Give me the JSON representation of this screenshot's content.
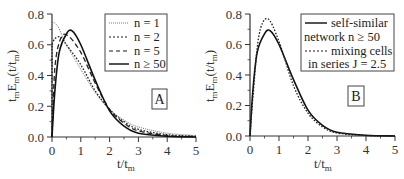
{
  "chart_data": [
    {
      "panel": "A",
      "type": "line",
      "title": "",
      "xlabel": "t/t_m",
      "ylabel": "t_m E_m(t/t_m)",
      "xlim": [
        0,
        5
      ],
      "ylim": [
        0,
        0.8
      ],
      "xticks": [
        "0",
        "1",
        "2",
        "3",
        "4",
        "5"
      ],
      "yticks": [
        "0.0",
        "0.2",
        "0.4",
        "0.6",
        "0.8"
      ],
      "grid": false,
      "legend_position": "upper right",
      "series": [
        {
          "name": "n = 1",
          "style": "dotted-fine",
          "x": [
            0,
            0.2,
            0.5,
            1.0,
            1.5,
            2.0,
            2.5,
            3.0,
            4.0,
            5.0
          ],
          "y": [
            0.75,
            0.72,
            0.6,
            0.44,
            0.29,
            0.18,
            0.11,
            0.065,
            0.025,
            0.01
          ]
        },
        {
          "name": "n = 2",
          "style": "dotted",
          "x": [
            0,
            0.1,
            0.3,
            0.5,
            1.0,
            1.5,
            2.0,
            2.5,
            3.0,
            4.0,
            5.0
          ],
          "y": [
            0.6,
            0.64,
            0.65,
            0.6,
            0.47,
            0.3,
            0.18,
            0.1,
            0.05,
            0.015,
            0.005
          ]
        },
        {
          "name": "n = 5",
          "style": "dashed",
          "x": [
            0,
            0.1,
            0.3,
            0.55,
            1.0,
            1.5,
            2.0,
            2.5,
            3.0,
            4.0,
            5.0
          ],
          "y": [
            0,
            0.45,
            0.64,
            0.66,
            0.55,
            0.35,
            0.18,
            0.09,
            0.04,
            0.01,
            0.003
          ]
        },
        {
          "name": "n ≥ 50",
          "style": "solid",
          "x": [
            0,
            0.1,
            0.25,
            0.5,
            0.7,
            1.0,
            1.5,
            2.0,
            2.5,
            3.0,
            4.0,
            5.0
          ],
          "y": [
            0,
            0.3,
            0.55,
            0.67,
            0.69,
            0.6,
            0.37,
            0.17,
            0.07,
            0.025,
            0.005,
            0
          ]
        }
      ],
      "annotation": "A"
    },
    {
      "panel": "B",
      "type": "line",
      "title": "",
      "xlabel": "t/t_m",
      "ylabel": "t_m E_m(t/t_m)",
      "xlim": [
        0,
        5
      ],
      "ylim": [
        0,
        0.8
      ],
      "xticks": [
        "0",
        "1",
        "2",
        "3",
        "4",
        "5"
      ],
      "yticks": [
        "0.0",
        "0.2",
        "0.4",
        "0.6",
        "0.8"
      ],
      "grid": false,
      "legend_position": "upper right",
      "series": [
        {
          "name": "self-similar network n ≥ 50",
          "style": "solid",
          "x": [
            0,
            0.1,
            0.25,
            0.5,
            0.7,
            1.0,
            1.5,
            2.0,
            2.5,
            3.0,
            4.0,
            5.0
          ],
          "y": [
            0,
            0.3,
            0.55,
            0.67,
            0.69,
            0.6,
            0.37,
            0.17,
            0.07,
            0.025,
            0.005,
            0
          ]
        },
        {
          "name": "mixing cells in series J = 2.5",
          "style": "dotted",
          "x": [
            0,
            0.1,
            0.3,
            0.6,
            1.0,
            1.5,
            2.0,
            2.5,
            3.0,
            4.0,
            5.0
          ],
          "y": [
            0,
            0.25,
            0.65,
            0.77,
            0.62,
            0.33,
            0.15,
            0.06,
            0.02,
            0.003,
            0
          ]
        }
      ],
      "annotation": "B"
    }
  ],
  "panels": {
    "A": {
      "legend": [
        "n = 1",
        "n = 2",
        "n = 5",
        "n ≥ 50"
      ],
      "letter": "A",
      "xlabel_main": "t/t",
      "xlabel_sub": "m",
      "ylabel": "t_m E_m(t/t_m)"
    },
    "B": {
      "legend": [
        "self-similar",
        "network n ≥ 50",
        "mixing cells",
        "in series J = 2.5"
      ],
      "letter": "B",
      "xlabel_main": "t/t",
      "xlabel_sub": "m",
      "ylabel": "t_m E_m(t/t_m)"
    }
  },
  "colors": {
    "line": "#1a1a1a",
    "axis": "#333333",
    "frame": "#444444"
  }
}
